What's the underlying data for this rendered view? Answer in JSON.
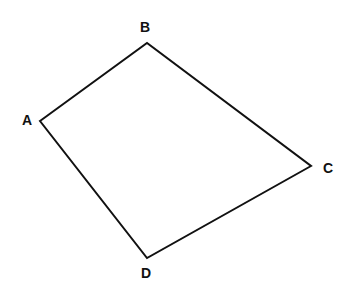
{
  "diagram": {
    "type": "quadrilateral",
    "vertices": [
      {
        "label": "A",
        "x": 40,
        "y": 121,
        "lx": 27,
        "ly": 125
      },
      {
        "label": "B",
        "x": 147,
        "y": 43,
        "lx": 145,
        "ly": 32
      },
      {
        "label": "C",
        "x": 311,
        "y": 166,
        "lx": 328,
        "ly": 173
      },
      {
        "label": "D",
        "x": 147,
        "y": 258,
        "lx": 146,
        "ly": 278
      }
    ],
    "edges": [
      [
        "A",
        "B"
      ],
      [
        "B",
        "C"
      ],
      [
        "C",
        "D"
      ],
      [
        "D",
        "A"
      ]
    ],
    "stroke_color": "#111111",
    "stroke_width": 2
  }
}
